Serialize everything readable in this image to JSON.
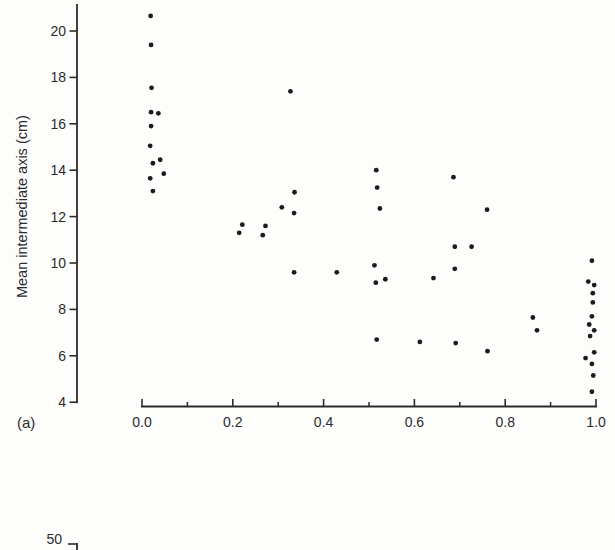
{
  "chart_data": {
    "type": "scatter",
    "title": "",
    "xlabel": "",
    "ylabel": "Mean intermediate axis (cm)",
    "xlim": [
      0.0,
      1.0
    ],
    "ylim": [
      4,
      21
    ],
    "grid": false,
    "legend": null,
    "x_major_ticks": [
      {
        "value": 0.0,
        "label": "0.0"
      },
      {
        "value": 0.2,
        "label": "0.2"
      },
      {
        "value": 0.4,
        "label": "0.4"
      },
      {
        "value": 0.6,
        "label": "0.6"
      },
      {
        "value": 0.8,
        "label": "0.8"
      },
      {
        "value": 1.0,
        "label": "1.0"
      }
    ],
    "x_minor_tick_values": [
      0.1,
      0.3,
      0.5,
      0.7,
      0.9
    ],
    "y_ticks": [
      {
        "value": 20,
        "label": "20"
      },
      {
        "value": 18,
        "label": "18"
      },
      {
        "value": 16,
        "label": "16"
      },
      {
        "value": 14,
        "label": "14"
      },
      {
        "value": 12,
        "label": "12"
      },
      {
        "value": 10,
        "label": "10"
      },
      {
        "value": 8,
        "label": "8"
      },
      {
        "value": 6,
        "label": "6"
      },
      {
        "value": 4,
        "label": "4"
      }
    ],
    "marker": {
      "shape": "dot",
      "color": "#1c1c1c",
      "radius_px": 2.4
    },
    "points": [
      [
        0.019,
        20.65
      ],
      [
        0.02,
        19.4
      ],
      [
        0.021,
        17.55
      ],
      [
        0.02,
        16.5
      ],
      [
        0.036,
        16.45
      ],
      [
        0.02,
        15.9
      ],
      [
        0.018,
        15.05
      ],
      [
        0.024,
        14.3
      ],
      [
        0.04,
        14.45
      ],
      [
        0.018,
        13.65
      ],
      [
        0.048,
        13.85
      ],
      [
        0.024,
        13.1
      ],
      [
        0.221,
        11.65
      ],
      [
        0.214,
        11.3
      ],
      [
        0.272,
        11.6
      ],
      [
        0.266,
        11.2
      ],
      [
        0.327,
        17.4
      ],
      [
        0.308,
        12.4
      ],
      [
        0.336,
        13.05
      ],
      [
        0.335,
        12.15
      ],
      [
        0.335,
        9.6
      ],
      [
        0.429,
        9.6
      ],
      [
        0.516,
        14.0
      ],
      [
        0.518,
        13.25
      ],
      [
        0.524,
        12.35
      ],
      [
        0.512,
        9.9
      ],
      [
        0.515,
        9.15
      ],
      [
        0.536,
        9.3
      ],
      [
        0.517,
        6.7
      ],
      [
        0.642,
        9.35
      ],
      [
        0.612,
        6.6
      ],
      [
        0.686,
        13.7
      ],
      [
        0.689,
        10.7
      ],
      [
        0.726,
        10.7
      ],
      [
        0.689,
        9.75
      ],
      [
        0.691,
        6.55
      ],
      [
        0.76,
        12.3
      ],
      [
        0.761,
        6.2
      ],
      [
        0.861,
        7.65
      ],
      [
        0.87,
        7.1
      ],
      [
        0.991,
        10.1
      ],
      [
        0.983,
        9.2
      ],
      [
        0.996,
        9.05
      ],
      [
        0.993,
        8.7
      ],
      [
        0.993,
        8.3
      ],
      [
        0.991,
        7.7
      ],
      [
        0.985,
        7.35
      ],
      [
        0.996,
        7.1
      ],
      [
        0.987,
        6.85
      ],
      [
        0.996,
        6.15
      ],
      [
        0.977,
        5.9
      ],
      [
        0.991,
        5.65
      ],
      [
        0.994,
        5.15
      ],
      [
        0.991,
        4.45
      ]
    ]
  },
  "panel_label": "(a)",
  "next_panel_fragment": {
    "y_tick_label": "50"
  },
  "colors": {
    "axis": "#2b2b2b",
    "text": "#2b2b2b",
    "marker": "#1c1c1c",
    "background": "#fdfdfc"
  }
}
